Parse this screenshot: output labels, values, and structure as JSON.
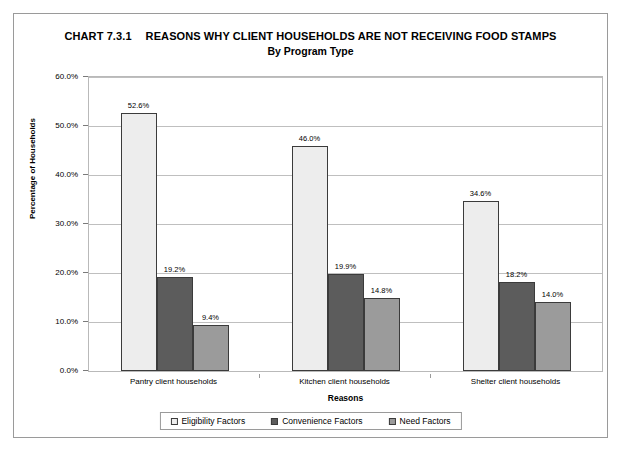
{
  "chart_data": {
    "type": "bar",
    "title_chart_number": "CHART 7.3.1",
    "title_main": "REASONS WHY CLIENT HOUSEHOLDS ARE NOT RECEIVING FOOD STAMPS",
    "subtitle": "By Program Type",
    "xlabel": "Reasons",
    "ylabel": "Percentage of Households",
    "categories": [
      "Pantry client households",
      "Kitchen client households",
      "Shelter client households"
    ],
    "series": [
      {
        "name": "Eligibility Factors",
        "color": "#ededed",
        "values": [
          52.6,
          46.0,
          34.6
        ],
        "labels": [
          "52.6%",
          "46.0%",
          "34.6%"
        ]
      },
      {
        "name": "Convenience Factors",
        "color": "#5c5c5c",
        "values": [
          19.2,
          19.9,
          18.2
        ],
        "labels": [
          "19.2%",
          "19.9%",
          "18.2%"
        ]
      },
      {
        "name": "Need Factors",
        "color": "#9b9b9b",
        "values": [
          9.4,
          14.8,
          14.0
        ],
        "labels": [
          "9.4%",
          "14.8%",
          "14.0%"
        ]
      }
    ],
    "ylim": [
      0,
      60
    ],
    "ytick_values": [
      0,
      10,
      20,
      30,
      40,
      50,
      60
    ],
    "ytick_labels": [
      "0.0%",
      "10.0%",
      "20.0%",
      "30.0%",
      "40.0%",
      "50.0%",
      "60.0%"
    ],
    "grid": true,
    "legend_position": "bottom"
  }
}
